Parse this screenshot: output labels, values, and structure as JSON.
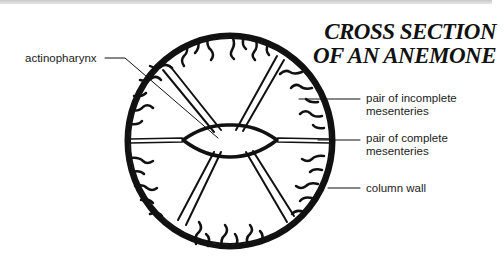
{
  "title": {
    "line1": "CROSS SECTION",
    "line2": "OF AN ANEMONE"
  },
  "labels": {
    "actinopharynx": "actinopharynx",
    "incomplete_line1": "pair of  incomplete",
    "incomplete_line2": "mesenteries",
    "complete_line1": "pair of complete",
    "complete_line2": "mesenteries",
    "column_wall": "column wall"
  },
  "colors": {
    "ink": "#111111",
    "background": "#ffffff"
  }
}
